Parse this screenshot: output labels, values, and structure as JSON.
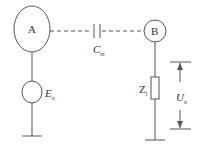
{
  "diagram": {
    "nodes": {
      "A": {
        "label": "A"
      },
      "B": {
        "label": "B"
      }
    },
    "capacitor": {
      "label": "C",
      "sub": "m"
    },
    "source": {
      "label": "E",
      "sub": "n"
    },
    "impedance": {
      "label": "Z",
      "sub": "l"
    },
    "voltage": {
      "label": "U",
      "sub": "n"
    }
  },
  "colors": {
    "line": "#555555",
    "text": "#333333"
  }
}
